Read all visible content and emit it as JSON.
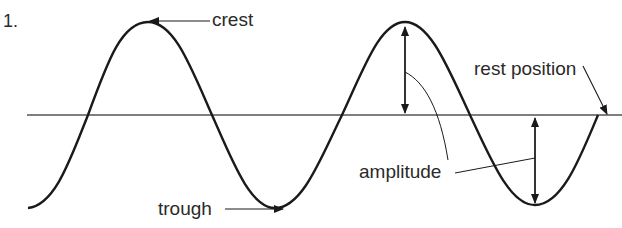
{
  "figure": {
    "number_label": "1.",
    "labels": {
      "crest": "crest",
      "trough": "trough",
      "rest_position": "rest position",
      "amplitude": "amplitude"
    },
    "wave": {
      "description": "transverse wave, about 1.5 wavelengths, two crests and three troughs",
      "stroke_color": "#1a1a1a",
      "rest_line_color": "#555555"
    }
  }
}
